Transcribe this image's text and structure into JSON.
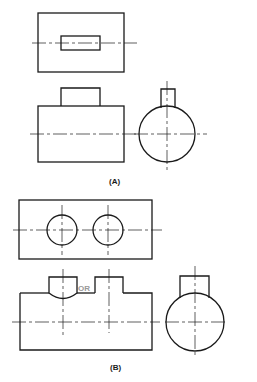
{
  "figures": [
    {
      "id": "A",
      "caption": "(A)",
      "views": [
        "top-view",
        "front-view",
        "side-view"
      ]
    },
    {
      "id": "B",
      "caption": "(B)",
      "views": [
        "top-view",
        "front-view",
        "side-view"
      ],
      "alternative_label": "OR"
    }
  ],
  "colors": {
    "line": "#1a1a1a",
    "or_label": "#9a9a9a",
    "background": "#ffffff"
  }
}
